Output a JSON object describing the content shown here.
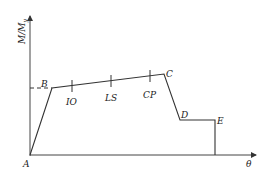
{
  "diagram": {
    "title": "",
    "y_axis_label": "M/M",
    "y_axis_label_subscript": "y",
    "x_axis_label": "θ",
    "points": [
      {
        "name": "A",
        "x": 30,
        "y": 155
      },
      {
        "name": "B",
        "x": 52,
        "y": 88
      },
      {
        "name": "C",
        "x": 164,
        "y": 74
      },
      {
        "name": "D",
        "x": 180,
        "y": 120
      },
      {
        "name": "E",
        "x": 215,
        "y": 120
      }
    ],
    "point_labels": {
      "A": "A",
      "B": "B",
      "C": "C",
      "D": "D",
      "E": "E"
    },
    "performance_levels": [
      {
        "label": "IO",
        "x": 72
      },
      {
        "label": "LS",
        "x": 111
      },
      {
        "label": "CP",
        "x": 150
      }
    ],
    "colors": {
      "line": "#333333",
      "axis": "#444444",
      "text": "#222222"
    }
  }
}
